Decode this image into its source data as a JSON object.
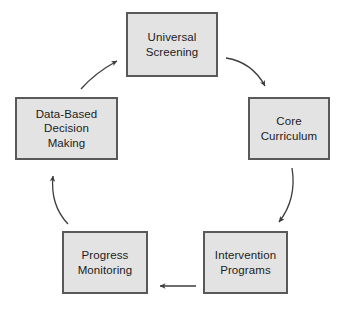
{
  "diagram": {
    "type": "cycle",
    "direction": "clockwise",
    "background_color": "#ffffff",
    "node_fill_color": "#e3e3e3",
    "node_border_color": "#595959",
    "arrow_color": "#3c3c3c",
    "text_color": "#1c1c1c",
    "nodes": [
      {
        "id": "universal-screening",
        "label": "Universal\nScreening",
        "position": "top"
      },
      {
        "id": "core-curriculum",
        "label": "Core\nCurriculum",
        "position": "right"
      },
      {
        "id": "intervention-programs",
        "label": "Intervention\nPrograms",
        "position": "bottom-right"
      },
      {
        "id": "progress-monitoring",
        "label": "Progress\nMonitoring",
        "position": "bottom-left"
      },
      {
        "id": "data-based-decision-making",
        "label": "Data-Based\nDecision\nMaking",
        "position": "left"
      }
    ],
    "arrows": [
      {
        "id": "arrow-screening-to-curriculum",
        "from": "universal-screening",
        "to": "core-curriculum",
        "style": "curved",
        "points_to": "down-right"
      },
      {
        "id": "arrow-curriculum-to-intervention",
        "from": "core-curriculum",
        "to": "intervention-programs",
        "style": "curved",
        "points_to": "down-left"
      },
      {
        "id": "arrow-intervention-to-progress",
        "from": "intervention-programs",
        "to": "progress-monitoring",
        "style": "straight",
        "points_to": "left"
      },
      {
        "id": "arrow-progress-to-data",
        "from": "progress-monitoring",
        "to": "data-based-decision-making",
        "style": "curved",
        "points_to": "up"
      },
      {
        "id": "arrow-data-to-screening",
        "from": "data-based-decision-making",
        "to": "universal-screening",
        "style": "curved",
        "points_to": "up-right"
      }
    ]
  }
}
